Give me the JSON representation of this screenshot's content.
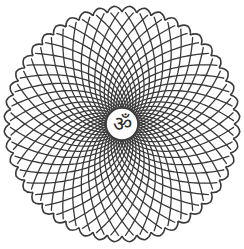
{
  "image": {
    "subject": "Om symbol mandala",
    "center_symbol": "ॐ",
    "description": "Circular lotus mandala made of interlocking spiral lattice with pointed petal edges and central Om symbol"
  },
  "style": {
    "stroke_color": "#3a3a3a",
    "background": "#ffffff",
    "petal_count": 48,
    "center": [
      122,
      124
    ],
    "outer_radius": 118,
    "inner_radius": 16
  }
}
